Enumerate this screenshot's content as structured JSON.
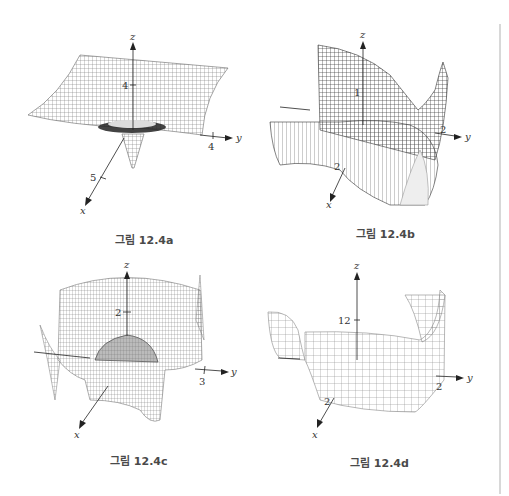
{
  "figures": [
    {
      "id": "a",
      "caption": "그림 12.4a",
      "axes": {
        "x": "x",
        "y": "y",
        "z": "z"
      },
      "ticks": {
        "z": "4",
        "y": "4",
        "x": "5"
      }
    },
    {
      "id": "b",
      "caption": "그림 12.4b",
      "axes": {
        "x": "x",
        "y": "y",
        "z": "z"
      },
      "ticks": {
        "z": "1",
        "y": "2",
        "x": "2"
      }
    },
    {
      "id": "c",
      "caption": "그림 12.4c",
      "axes": {
        "x": "x",
        "y": "y",
        "z": "z"
      },
      "ticks": {
        "z": "2",
        "y": "3"
      }
    },
    {
      "id": "d",
      "caption": "그림 12.4d",
      "axes": {
        "x": "x",
        "y": "y",
        "z": "z"
      },
      "ticks": {
        "z": "12",
        "y": "2",
        "x": "2"
      }
    }
  ],
  "colors": {
    "mesh": "#555555",
    "axis": "#222222",
    "caption": "#4a4a4a",
    "divider": "#d8d8d8"
  }
}
